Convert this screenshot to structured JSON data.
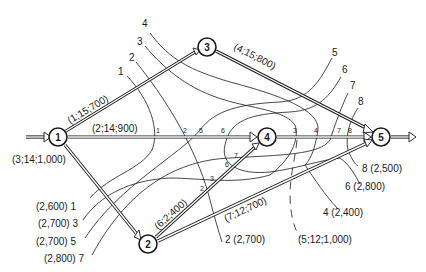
{
  "diagram": {
    "type": "network-cut-diagram",
    "colors": {
      "ink": "#1a1a1a",
      "background": "#ffffff"
    },
    "nodes": [
      {
        "id": "1",
        "label": "1",
        "x": 58,
        "y": 137
      },
      {
        "id": "2",
        "label": "2",
        "x": 148,
        "y": 244
      },
      {
        "id": "3",
        "label": "3",
        "x": 207,
        "y": 47
      },
      {
        "id": "4",
        "label": "4",
        "x": 267,
        "y": 137
      },
      {
        "id": "5",
        "label": "5",
        "x": 381,
        "y": 137
      }
    ],
    "arcs": [
      {
        "from": "1",
        "to": "3",
        "label": "(1;15;700)"
      },
      {
        "from": "1",
        "to": "4",
        "label": "(2;14;900)"
      },
      {
        "from": "1",
        "to": "2",
        "label": "(3;14;1,000)"
      },
      {
        "from": "3",
        "to": "5",
        "label": "(4;15;800)"
      },
      {
        "from": "4",
        "to": "5",
        "label": "(5;12;1,000)"
      },
      {
        "from": "2",
        "to": "4",
        "label": "(6;2;400)"
      },
      {
        "from": "2",
        "to": "5",
        "label": "(7;12;700)"
      }
    ],
    "source_arrow": {
      "to": "1"
    },
    "sink_arrow": {
      "from": "5"
    },
    "cuts": [
      {
        "id": "1",
        "label": "1",
        "value": "(2,600)"
      },
      {
        "id": "2",
        "label": "2",
        "value": "(2,700)"
      },
      {
        "id": "3",
        "label": "3",
        "value": "(2,700)"
      },
      {
        "id": "4",
        "label": "4",
        "value": "(2,400)"
      },
      {
        "id": "5",
        "label": "5",
        "value": "(2,700)"
      },
      {
        "id": "6",
        "label": "6",
        "value": "(2,800)"
      },
      {
        "id": "7",
        "label": "7",
        "value": "(2,800)"
      },
      {
        "id": "8",
        "label": "8",
        "value": "(2,500)"
      }
    ],
    "inline_cut_marks": [
      "1",
      "2",
      "5",
      "6",
      "3",
      "4",
      "7",
      "8"
    ]
  }
}
